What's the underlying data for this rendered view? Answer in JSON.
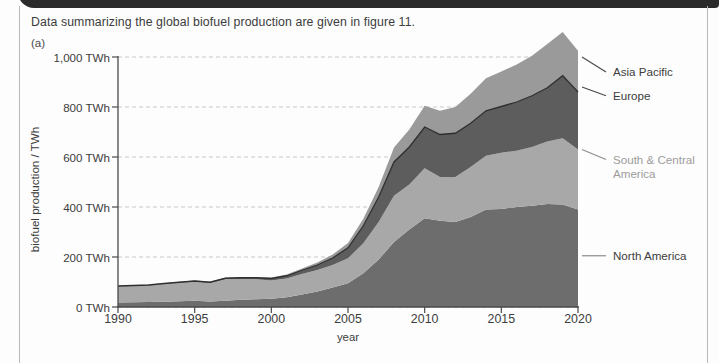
{
  "page": {
    "prompt": "Data summarizing the global biofuel production are given in figure 11.",
    "part_label": "(a)"
  },
  "chart_data": {
    "type": "area",
    "stacked": true,
    "title": "",
    "xlabel": "year",
    "ylabel": "biofuel production / TWh",
    "xlim": [
      1990,
      2020
    ],
    "ylim": [
      0,
      1000
    ],
    "xticks": [
      1990,
      1995,
      2000,
      2005,
      2010,
      2015,
      2020
    ],
    "xtick_labels": [
      "1990",
      "1995",
      "2000",
      "2005",
      "2010",
      "2015",
      "2020"
    ],
    "yticks": [
      0,
      200,
      400,
      600,
      800,
      1000
    ],
    "ytick_labels": [
      "0 TWh",
      "200 TWh",
      "400 TWh",
      "600 TWh",
      "800 TWh",
      "1,000 TWh"
    ],
    "grid": "horizontal-dashed",
    "legend_position": "right-outside",
    "x": [
      1990,
      1991,
      1992,
      1993,
      1994,
      1995,
      1996,
      1997,
      1998,
      1999,
      2000,
      2001,
      2002,
      2003,
      2004,
      2005,
      2006,
      2007,
      2008,
      2009,
      2010,
      2011,
      2012,
      2013,
      2014,
      2015,
      2016,
      2017,
      2018,
      2019,
      2020
    ],
    "series": [
      {
        "name": "North America",
        "color": "#6d6d6d",
        "values": [
          18,
          19,
          20,
          21,
          23,
          25,
          22,
          25,
          29,
          31,
          33,
          39,
          50,
          62,
          78,
          95,
          135,
          190,
          260,
          310,
          355,
          345,
          340,
          360,
          390,
          392,
          400,
          405,
          412,
          410,
          390
        ]
      },
      {
        "name": "South & Central America",
        "color": "#a8a8a8",
        "values": [
          65,
          66,
          67,
          71,
          74,
          76,
          74,
          86,
          83,
          80,
          73,
          75,
          82,
          86,
          90,
          100,
          120,
          150,
          185,
          180,
          200,
          175,
          180,
          200,
          215,
          225,
          225,
          235,
          250,
          265,
          240
        ]
      },
      {
        "name": "Europe",
        "color": "#5d5d5d",
        "values": [
          1,
          1,
          1,
          2,
          2,
          3,
          3,
          4,
          5,
          6,
          8,
          11,
          15,
          20,
          28,
          42,
          70,
          100,
          135,
          150,
          165,
          170,
          175,
          175,
          180,
          185,
          195,
          205,
          215,
          250,
          230
        ]
      },
      {
        "name": "Asia Pacific",
        "color": "#9a9a9a",
        "values": [
          1,
          1,
          1,
          1,
          2,
          2,
          2,
          2,
          3,
          3,
          4,
          5,
          7,
          10,
          14,
          19,
          28,
          40,
          58,
          70,
          85,
          95,
          105,
          118,
          130,
          140,
          150,
          160,
          175,
          175,
          165
        ]
      }
    ],
    "legend": [
      {
        "label": "Asia Pacific",
        "color": "#9a9a9a"
      },
      {
        "label": "Europe",
        "color": "#5d5d5d"
      },
      {
        "label": "South & Central\nAmerica",
        "color": "#a8a8a8"
      },
      {
        "label": "North America",
        "color": "#6d6d6d"
      }
    ],
    "legend_anchor_values": [
      1000,
      880,
      630,
      205
    ],
    "legend_text_values": [
      940,
      845,
      590,
      205
    ]
  },
  "colors": {
    "axis": "#4a4a4a",
    "grid": "#c9c9c9",
    "legend_text_light": "#9c9c9c",
    "legend_text_dark": "#3c3c3c",
    "band_edge": "#2f2f2f"
  }
}
